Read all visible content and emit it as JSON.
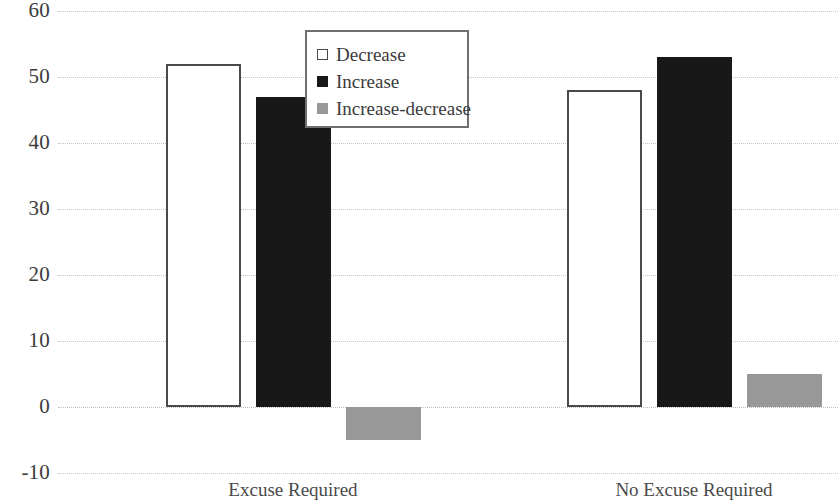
{
  "chart_data": {
    "type": "bar",
    "title": "",
    "subtitle": "",
    "xlabel": "",
    "ylabel": "",
    "categories": [
      "Excuse Required",
      "No Excuse Required"
    ],
    "series": [
      {
        "name": "Decrease",
        "color": "#ffffff",
        "border": "#4a4a4a",
        "values": [
          52,
          48
        ]
      },
      {
        "name": "Increase",
        "color": "#181818",
        "border": "#181818",
        "values": [
          47,
          53
        ]
      },
      {
        "name": "Increase-decrease",
        "color": "#989898",
        "border": "#989898",
        "values": [
          -5,
          5
        ]
      }
    ],
    "ylim": [
      -10,
      60
    ],
    "ytick_labels": [
      "60",
      "50",
      "40",
      "30",
      "20",
      "10",
      "0",
      "-10"
    ],
    "ytick_values": [
      60,
      50,
      40,
      30,
      20,
      10,
      0,
      -10
    ],
    "grid": true,
    "grid_axis": "y",
    "legend_position": "upper-center",
    "legend_entries": [
      "Decrease",
      "Increase",
      "Increase-decrease"
    ],
    "annotations": []
  }
}
